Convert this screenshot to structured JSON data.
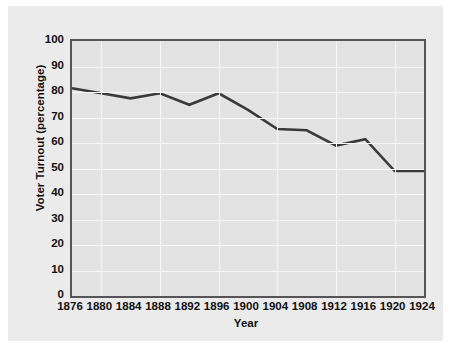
{
  "chart_data": {
    "type": "line",
    "title": "",
    "xlabel": "Year",
    "ylabel": "Voter Turnout (percentage)",
    "x": [
      1876,
      1880,
      1884,
      1888,
      1892,
      1896,
      1900,
      1904,
      1908,
      1912,
      1916,
      1920,
      1924
    ],
    "xtick_labels": [
      "1876",
      "1880",
      "1884",
      "1888",
      "1892",
      "1896",
      "1900",
      "1904",
      "1908",
      "1912",
      "1916",
      "1920",
      "1924"
    ],
    "values": [
      81.5,
      79.5,
      77.5,
      79.5,
      75.0,
      79.5,
      73.0,
      65.5,
      65.0,
      59.0,
      61.5,
      49.0,
      49.0
    ],
    "series": [
      {
        "name": "Voter Turnout",
        "values": [
          81.5,
          79.5,
          77.5,
          79.5,
          75.0,
          79.5,
          73.0,
          65.5,
          65.0,
          59.0,
          61.5,
          49.0,
          49.0
        ]
      }
    ],
    "ylim": [
      0,
      100
    ],
    "xlim": [
      1876,
      1924
    ],
    "ytick_labels": [
      "100",
      "90",
      "80",
      "70",
      "60",
      "50",
      "40",
      "30",
      "20",
      "10",
      "0"
    ],
    "yticks": [
      100,
      90,
      80,
      70,
      60,
      50,
      40,
      30,
      20,
      10,
      0
    ],
    "grid": true,
    "legend": false,
    "legend_position": "none",
    "colors": {
      "line": "#3a3a3a",
      "plot_background": "#e3e3e3",
      "figure_background": "#ebebeb",
      "gridline": "#f7f7f7",
      "axis_border": "#555555",
      "text": "#111111"
    }
  }
}
